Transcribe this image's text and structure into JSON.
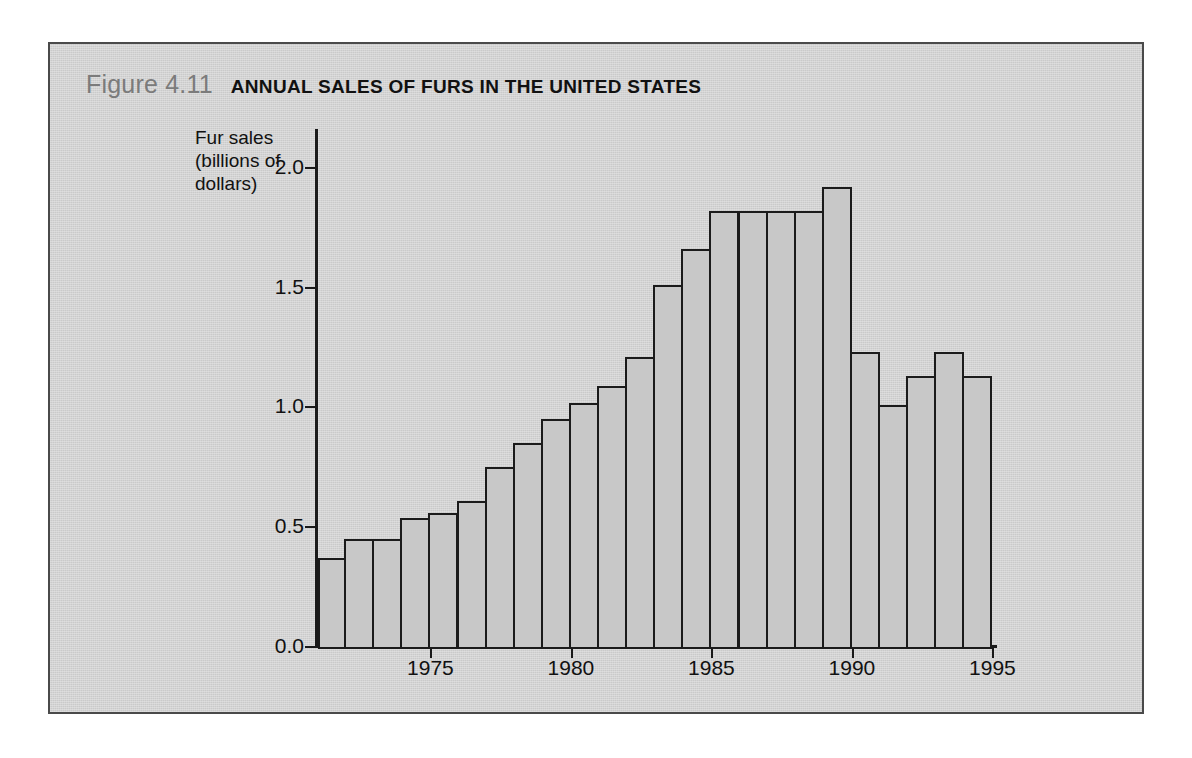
{
  "figure": {
    "number": "Figure 4.11",
    "title": "ANNUAL SALES OF FURS IN THE UNITED STATES"
  },
  "colors": {
    "panel_background": "#d2d2d2",
    "panel_border": "#4a4a4a",
    "bar_fill": "#c8c8c8",
    "bar_outline": "#1b1b1b",
    "axis": "#1a1a1a",
    "figure_number_text": "#7b7b7b",
    "title_text": "#111111"
  },
  "chart_data": {
    "type": "bar",
    "title": "ANNUAL SALES OF FURS IN THE UNITED STATES",
    "xlabel": "",
    "ylabel": "Fur sales\n(billions of\ndollars)",
    "ylim": [
      0.0,
      2.15
    ],
    "xlim": [
      1971,
      1995.7
    ],
    "grid": false,
    "legend": null,
    "ytick_labels": [
      "0.0",
      "0.5",
      "1.0",
      "1.5",
      "2.0"
    ],
    "ytick_values": [
      0.0,
      0.5,
      1.0,
      1.5,
      2.0
    ],
    "xtick_labels": [
      "1975",
      "1980",
      "1985",
      "1990",
      "1995"
    ],
    "xtick_values": [
      1975,
      1980,
      1985,
      1990,
      1995
    ],
    "categories": [
      1971,
      1972,
      1973,
      1974,
      1975,
      1976,
      1977,
      1978,
      1979,
      1980,
      1981,
      1982,
      1983,
      1984,
      1985,
      1986,
      1987,
      1988,
      1989,
      1990,
      1991,
      1992,
      1993,
      1994
    ],
    "values": [
      0.37,
      0.45,
      0.45,
      0.54,
      0.56,
      0.61,
      0.75,
      0.85,
      0.95,
      1.02,
      1.09,
      1.21,
      1.51,
      1.66,
      1.82,
      1.82,
      1.82,
      1.82,
      1.92,
      1.23,
      1.01,
      1.13,
      1.23,
      1.13
    ]
  }
}
